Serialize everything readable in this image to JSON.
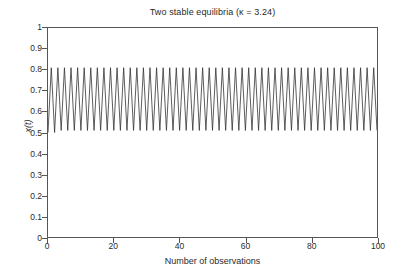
{
  "chart_data": {
    "type": "line",
    "title": "Two stable equilibria (κ = 3.24)",
    "xlabel": "Number of observations",
    "ylabel": "x(t)",
    "xlim": [
      0,
      100
    ],
    "ylim": [
      0,
      1
    ],
    "xticks": [
      0,
      20,
      40,
      60,
      80,
      100
    ],
    "yticks": [
      0,
      0.1,
      0.2,
      0.3,
      0.4,
      0.5,
      0.6,
      0.7,
      0.8,
      0.9,
      1
    ],
    "xtick_labels": [
      "0",
      "20",
      "40",
      "60",
      "80",
      "100"
    ],
    "ytick_labels": [
      "0",
      "0.1",
      "0.2",
      "0.3",
      "0.4",
      "0.5",
      "0.6",
      "0.7",
      "0.8",
      "0.9",
      "1"
    ],
    "grid": false,
    "legend": false,
    "line_color": "#333333",
    "line_width": 0.8,
    "annotations": [
      "period-2 cycle between the two stable equilibria",
      "kappa = 3.24"
    ],
    "series": [
      {
        "name": "x(t)",
        "x": [
          0,
          1,
          2,
          3,
          4,
          5,
          6,
          7,
          8,
          9,
          10,
          11,
          12,
          13,
          14,
          15,
          16,
          17,
          18,
          19,
          20,
          21,
          22,
          23,
          24,
          25,
          26,
          27,
          28,
          29,
          30,
          31,
          32,
          33,
          34,
          35,
          36,
          37,
          38,
          39,
          40,
          41,
          42,
          43,
          44,
          45,
          46,
          47,
          48,
          49,
          50,
          51,
          52,
          53,
          54,
          55,
          56,
          57,
          58,
          59,
          60,
          61,
          62,
          63,
          64,
          65,
          66,
          67,
          68,
          69,
          70,
          71,
          72,
          73,
          74,
          75,
          76,
          77,
          78,
          79,
          80,
          81,
          82,
          83,
          84,
          85,
          86,
          87,
          88,
          89,
          90,
          91,
          92,
          93,
          94,
          95,
          96,
          97,
          98,
          99,
          100
        ],
        "values": [
          0.5,
          0.81,
          0.5,
          0.81,
          0.51,
          0.81,
          0.51,
          0.81,
          0.51,
          0.81,
          0.51,
          0.81,
          0.51,
          0.81,
          0.51,
          0.81,
          0.51,
          0.81,
          0.51,
          0.81,
          0.51,
          0.81,
          0.51,
          0.81,
          0.51,
          0.81,
          0.51,
          0.81,
          0.51,
          0.81,
          0.51,
          0.81,
          0.51,
          0.81,
          0.51,
          0.81,
          0.51,
          0.81,
          0.51,
          0.81,
          0.51,
          0.81,
          0.51,
          0.81,
          0.51,
          0.81,
          0.51,
          0.81,
          0.51,
          0.81,
          0.51,
          0.81,
          0.51,
          0.81,
          0.51,
          0.81,
          0.51,
          0.81,
          0.51,
          0.81,
          0.51,
          0.81,
          0.51,
          0.81,
          0.51,
          0.81,
          0.51,
          0.81,
          0.51,
          0.81,
          0.51,
          0.81,
          0.51,
          0.81,
          0.51,
          0.81,
          0.51,
          0.81,
          0.51,
          0.81,
          0.51,
          0.81,
          0.51,
          0.81,
          0.51,
          0.81,
          0.51,
          0.81,
          0.51,
          0.81,
          0.51,
          0.81,
          0.51,
          0.81,
          0.51,
          0.81,
          0.51,
          0.81,
          0.51,
          0.81,
          0.51
        ]
      }
    ]
  }
}
